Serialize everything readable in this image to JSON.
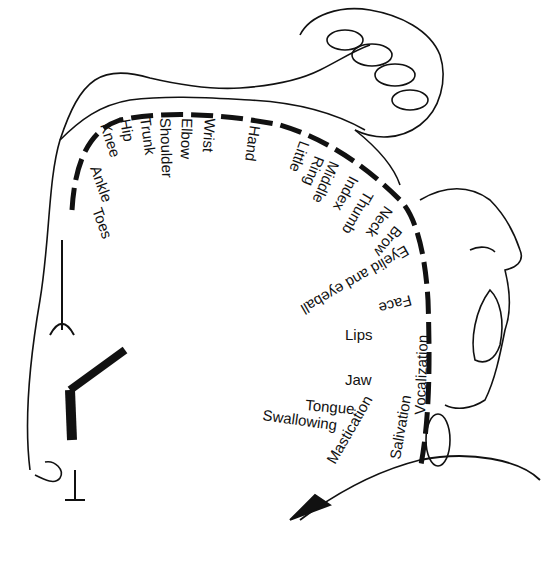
{
  "diagram": {
    "labels": {
      "toes": "Toes",
      "ankle": "Ankle",
      "knee": "Knee",
      "hip": "Hip",
      "trunk": "Trunk",
      "shoulder": "Shoulder",
      "elbow": "Elbow",
      "wrist": "Wrist",
      "hand": "Hand",
      "little": "Little",
      "ring": "Ring",
      "middle": "Middle",
      "index": "Index",
      "thumb": "Thumb",
      "neck": "Neck",
      "brow": "Brow",
      "eyelid": "Eyelid and eyeball",
      "face": "Face",
      "lips": "Lips",
      "jaw": "Jaw",
      "tongue": "Tongue",
      "swallowing": "Swallowing",
      "mastication": "Mastication",
      "salivation": "Salivation",
      "vocalization": "Vocalization"
    }
  }
}
